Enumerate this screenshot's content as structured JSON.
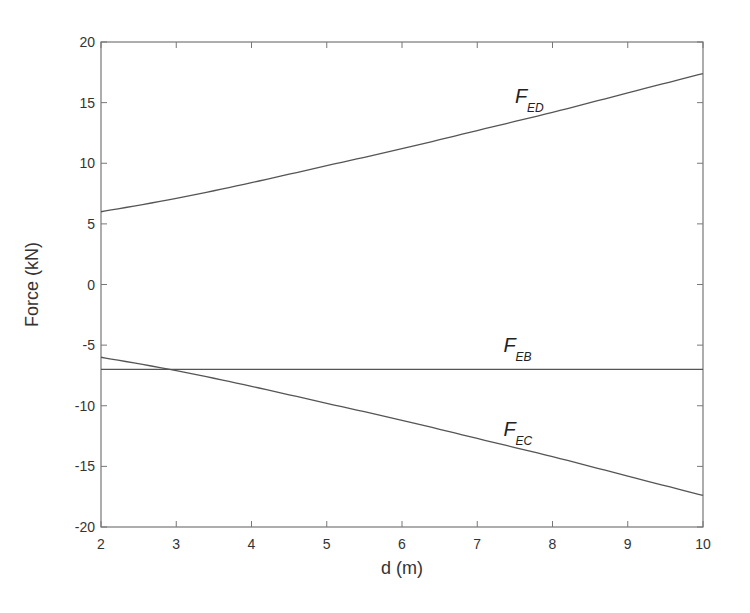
{
  "chart_data": {
    "type": "line",
    "title": "",
    "xlabel": "d (m)",
    "ylabel": "Force (kN)",
    "xlim": [
      2,
      10
    ],
    "ylim": [
      -20,
      20
    ],
    "xticks": [
      2,
      3,
      4,
      5,
      6,
      7,
      8,
      9,
      10
    ],
    "yticks": [
      -20,
      -15,
      -10,
      -5,
      0,
      5,
      10,
      15,
      20
    ],
    "grid": false,
    "legend": "none",
    "x": [
      2,
      3,
      4,
      5,
      6,
      7,
      8,
      9,
      10
    ],
    "series": [
      {
        "name": "F_ED",
        "label_main": "F",
        "label_sub": "ED",
        "label_at": [
          7.5,
          15.0
        ],
        "values": [
          6.0,
          7.1,
          8.4,
          9.8,
          11.2,
          12.7,
          14.2,
          15.8,
          17.4
        ]
      },
      {
        "name": "F_EB",
        "label_main": "F",
        "label_sub": "EB",
        "label_at": [
          7.35,
          -5.6
        ],
        "values": [
          -7,
          -7,
          -7,
          -7,
          -7,
          -7,
          -7,
          -7,
          -7
        ]
      },
      {
        "name": "F_EC",
        "label_main": "F",
        "label_sub": "EC",
        "label_at": [
          7.35,
          -12.5
        ],
        "values": [
          -6.0,
          -7.1,
          -8.4,
          -9.8,
          -11.2,
          -12.7,
          -14.2,
          -15.8,
          -17.4
        ]
      }
    ],
    "line_color": "#555555"
  }
}
